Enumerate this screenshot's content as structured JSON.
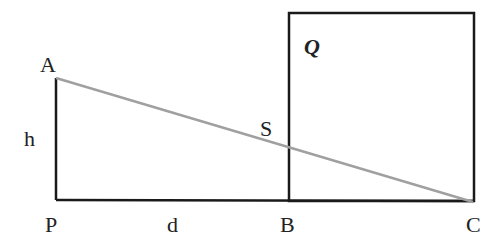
{
  "diagram": {
    "points": {
      "A": {
        "label": "A",
        "x": 56,
        "y": 78
      },
      "P": {
        "label": "P",
        "x": 56,
        "y": 200
      },
      "B": {
        "label": "B",
        "x": 289,
        "y": 200
      },
      "C": {
        "label": "C",
        "x": 473,
        "y": 202
      },
      "S": {
        "label": "S",
        "x": 289,
        "y": 148
      }
    },
    "labels": {
      "A": "A",
      "P": "P",
      "B": "B",
      "C": "C",
      "S": "S",
      "h": "h",
      "d": "d",
      "Q": "Q"
    },
    "colors": {
      "lines": "#1a1a1a",
      "hypotenuse": "#a0a0a0",
      "text": "#222222"
    }
  }
}
